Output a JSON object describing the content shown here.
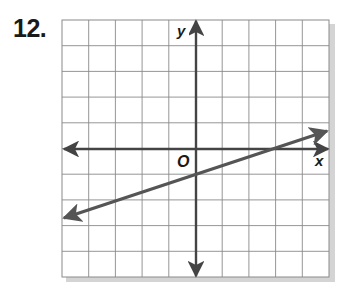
{
  "problem": {
    "number_label": "12."
  },
  "colors": {
    "grid": "#8a8a8a",
    "axis": "#444444",
    "line": "#555555",
    "shadow": "#cfcfcf",
    "text": "#1a1a1a"
  },
  "axes": {
    "x_label": "x",
    "y_label": "y",
    "origin_label": "O"
  },
  "chart_data": {
    "type": "line",
    "title": "12.",
    "xlabel": "x",
    "ylabel": "y",
    "xlim": [
      -5,
      5
    ],
    "ylim": [
      -5,
      5
    ],
    "grid": true,
    "legend": null,
    "annotations": [
      "O (origin)"
    ],
    "series": [
      {
        "name": "line",
        "equation": "y = (1/3)x - 1",
        "slope": 0.3333,
        "y_intercept": -1,
        "x_intercept": 3,
        "points": [
          [
            -5,
            -2.67
          ],
          [
            0,
            -1
          ],
          [
            3,
            0
          ],
          [
            5,
            0.67
          ]
        ],
        "arrows_both_ends": true
      }
    ]
  }
}
